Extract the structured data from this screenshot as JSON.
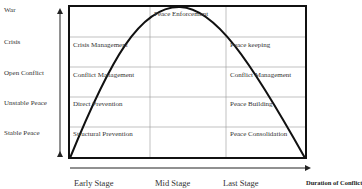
{
  "y_axis": {
    "levels": [
      "War",
      "Crisis",
      "Open Conflict",
      "Unstable Peace",
      "Stable Peace"
    ]
  },
  "x_axis": {
    "stages": [
      "Early Stage",
      "Mid Stage",
      "Last Stage"
    ],
    "title": "Duration of Conflict"
  },
  "cells": {
    "peace_enforcement": "Peace Enforcement",
    "crisis_management": "Crisis Management",
    "conflict_management_left": "Conflict Management",
    "direct_prevention": "Direct Prevention",
    "structural_prevention": "Structural Prevention",
    "peace_keeping": "Peace keeping",
    "conflict_management_right": "Conflict Management",
    "peace_building": "Peace Building",
    "peace_consolidation": "Peace Consolidation"
  },
  "colors": {
    "line": "#111111",
    "grid": "#999999",
    "text": "#333333"
  }
}
